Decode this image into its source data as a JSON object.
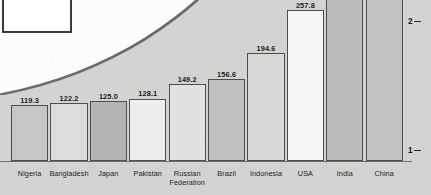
{
  "chart_data": {
    "type": "bar",
    "title": "",
    "subtitle": "",
    "xlabel": "",
    "ylabel": "",
    "grid": false,
    "legend": "none",
    "axis_side": "right",
    "ylim": [
      0,
      2.35
    ],
    "y_ticks": [
      "1",
      "2"
    ],
    "y_tick_positions": [
      1,
      2
    ],
    "categories": [
      "Nigeria",
      "Bangladesh",
      "Japan",
      "Pakistan",
      "Russian\nFederation",
      "Brazil",
      "Indonesia",
      "USA",
      "India",
      "China"
    ],
    "values": [
      119.3,
      122.2,
      125.0,
      128.1,
      149.2,
      156.6,
      194.6,
      257.8,
      null,
      null
    ],
    "value_labels": [
      "119.3",
      "122.2",
      "125.0",
      "128.1",
      "149.2",
      "156.6",
      "194.6",
      "257.8",
      "",
      ""
    ],
    "bar_fills": [
      "#c6c6c4",
      "#dcdcda",
      "#b4b4b2",
      "#eeeeec",
      "#e2e2e0",
      "#c0c0be",
      "#d8d8d6",
      "#f6f6f4",
      "#bcbcba",
      "#c2c2c0"
    ],
    "bar_outline_color": "#4d4d4d",
    "background_color": "#d3d3d1",
    "paper_color": "#fcfcfc",
    "text_color": "#1c1c1c"
  },
  "overlay": {
    "arc_label": "",
    "inner_box_label": ""
  }
}
